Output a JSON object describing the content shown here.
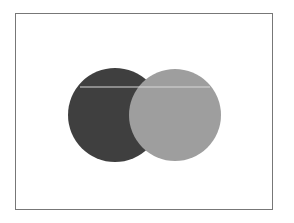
{
  "diagram": {
    "type": "venn",
    "frame": {
      "border_color": "#777777",
      "background": "#ffffff"
    },
    "circles": [
      {
        "id": "left",
        "cx": 115,
        "cy": 115,
        "r": 47,
        "fill": "#3f3f3f"
      },
      {
        "id": "right",
        "cx": 175,
        "cy": 115,
        "r": 46,
        "fill": "#9e9e9e"
      }
    ],
    "highlight_line": {
      "y": 87,
      "x1": 80,
      "x2": 210,
      "color": "#d8d8d8"
    }
  }
}
